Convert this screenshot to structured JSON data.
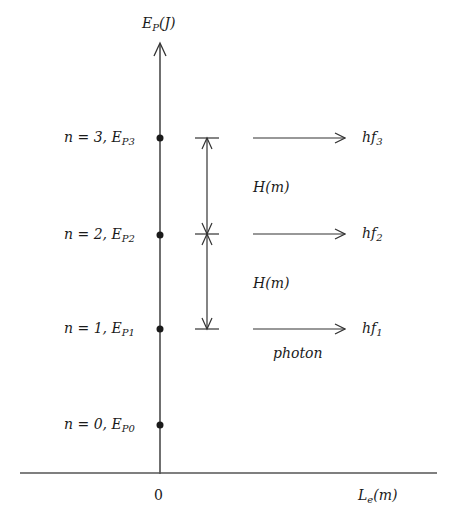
{
  "diagram": {
    "type": "energy-level diagram",
    "axes": {
      "y_label": {
        "main": "E",
        "sub": "P",
        "unit": "(J)"
      },
      "x_label": {
        "main": "L",
        "sub": "e",
        "unit": "(m)"
      },
      "origin_label": "0"
    },
    "levels": [
      {
        "n_label": "n = 3,",
        "energy": "E",
        "energy_sub": "P3",
        "photon": "hf",
        "photon_sub": "3"
      },
      {
        "n_label": "n = 2,",
        "energy": "E",
        "energy_sub": "P2",
        "photon": "hf",
        "photon_sub": "2"
      },
      {
        "n_label": "n = 1,",
        "energy": "E",
        "energy_sub": "P1",
        "photon": "hf",
        "photon_sub": "1"
      },
      {
        "n_label": "n = 0,",
        "energy": "E",
        "energy_sub": "P0"
      }
    ],
    "spacing_labels": [
      "H(m)",
      "H(m)"
    ],
    "photon_label": "photon",
    "colors": {
      "line": "#333333",
      "text": "#1a1a1a",
      "background": "#ffffff"
    }
  }
}
